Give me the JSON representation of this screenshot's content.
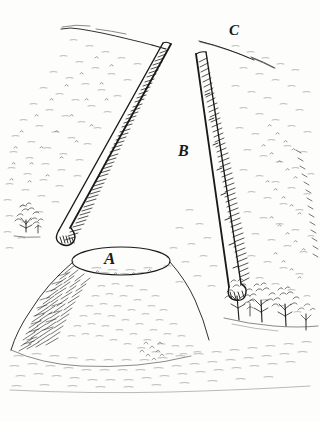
{
  "plate": {
    "title": "Earthwork and Mound Sketch",
    "medium": "pen and ink line drawing",
    "background_color": "#fdfdfb",
    "ink_color": "#1a1a18",
    "width": 320,
    "height": 421
  },
  "labels": {
    "a": "A",
    "b": "B",
    "c": "C"
  },
  "features": {
    "mound": {
      "name": "mound",
      "label": "A",
      "description": "conical mound with flat elliptical summit, heavily hatched on the left flank"
    },
    "enclosure": {
      "name": "enclosure-interior",
      "label": "B",
      "description": "open level interior between the two banks"
    },
    "outer_ground": {
      "name": "outer-ground",
      "label": "C",
      "description": "ground beyond the entrance gap at the far side"
    },
    "left_bank": {
      "name": "left-bank",
      "description": "long straight rampart running from upper right to lower left, rounded terminal"
    },
    "right_bank": {
      "name": "right-bank",
      "description": "long straight rampart running from upper left to lower right, hatched shadow face"
    },
    "entrance_gap": {
      "name": "entrance-gap",
      "description": "break between the two bank terminals at the top of the plate"
    },
    "trees": {
      "name": "tree-group",
      "count": 5,
      "description": "small deciduous trees along the foot of the right bank and one at the left margin"
    },
    "horizon": {
      "name": "horizon-line",
      "description": "sketchy skyline across the upper part of the plate"
    }
  }
}
